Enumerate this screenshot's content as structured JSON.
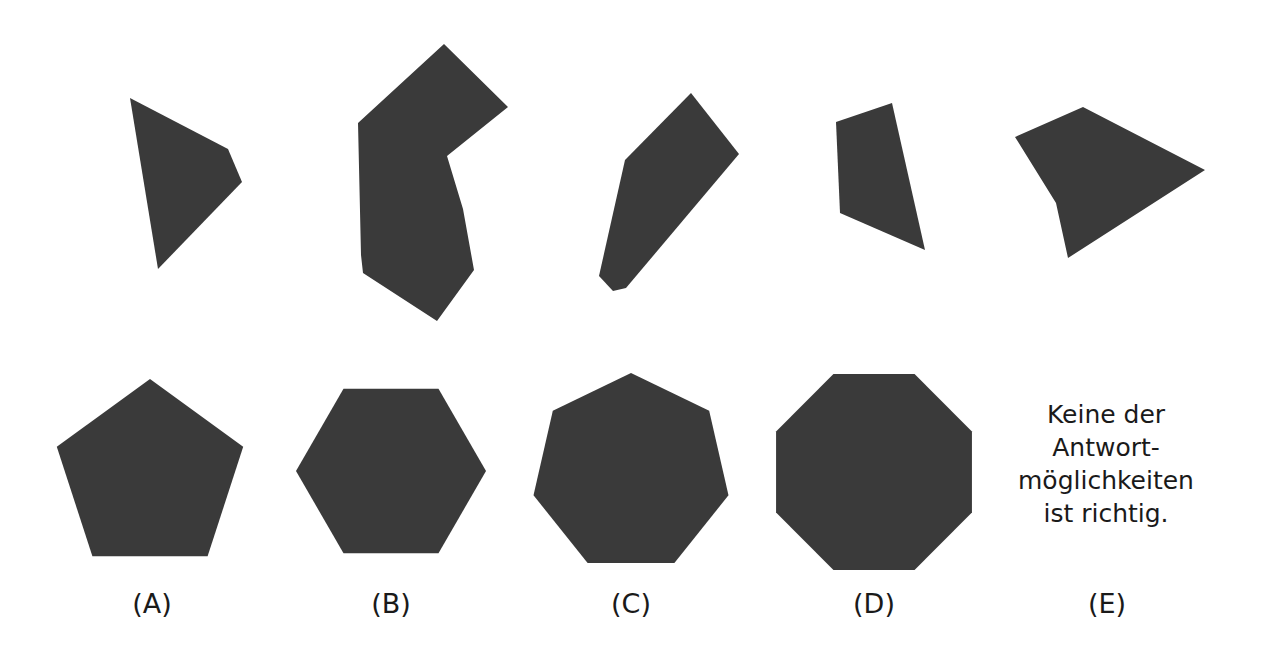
{
  "figure": {
    "background_color": "#ffffff",
    "shape_fill_color": "#3a3a3a",
    "text_color": "#1a1a1a",
    "width": 1263,
    "height": 659
  },
  "puzzle_pieces": [
    {
      "id": "piece-1",
      "name": "quadrilateral-piece-1",
      "points": "130,98 228,149 242,182 158,269"
    },
    {
      "id": "piece-2",
      "name": "concave-piece-2",
      "points": "444,44 508,107 447,156 463,209 474,270 437,321 363,273 361,255 358,123"
    },
    {
      "id": "piece-3",
      "name": "quadrilateral-piece-3",
      "points": "691,93 739,154 626,288 613,291 599,276 625,160"
    },
    {
      "id": "piece-4",
      "name": "quadrilateral-piece-4",
      "points": "836,122 892,103 925,250 840,213"
    },
    {
      "id": "piece-5",
      "name": "arrow-piece-5",
      "points": "1083,107 1205,170 1068,258 1056,203 1015,137"
    }
  ],
  "answer_options": [
    {
      "id": "option-a",
      "label": "(A)",
      "shape": "pentagon",
      "sides": 5,
      "cx": 150,
      "cy": 477,
      "r": 98,
      "rotation": -90,
      "label_x": 152,
      "label_y": 588
    },
    {
      "id": "option-b",
      "label": "(B)",
      "shape": "hexagon",
      "sides": 6,
      "cx": 391,
      "cy": 471,
      "r": 95,
      "rotation": 0,
      "label_x": 391,
      "label_y": 588
    },
    {
      "id": "option-c",
      "label": "(C)",
      "shape": "heptagon",
      "sides": 7,
      "cx": 631,
      "cy": 473,
      "r": 100,
      "rotation": -90,
      "label_x": 631,
      "label_y": 588
    },
    {
      "id": "option-d",
      "label": "(D)",
      "shape": "octagon",
      "sides": 8,
      "cx": 874,
      "cy": 472,
      "r": 106,
      "rotation": 22.5,
      "label_x": 874,
      "label_y": 588
    },
    {
      "id": "option-e",
      "label": "(E)",
      "shape": "text",
      "label_x": 1107,
      "label_y": 588
    }
  ],
  "none_of_the_above": {
    "lines": [
      "Keine der",
      "Antwort-",
      "möglichkeiten",
      "ist richtig."
    ]
  }
}
